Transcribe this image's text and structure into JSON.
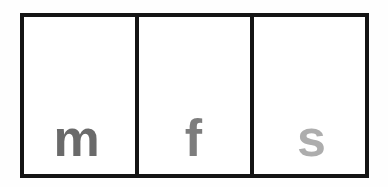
{
  "canvas": {
    "width": 388,
    "height": 187,
    "background_color": "#fefefe"
  },
  "figure": {
    "type": "three-cell-letter-strip",
    "border_color": "#141414",
    "border_width_px": 4,
    "cell_background": "#ffffff"
  },
  "cells": [
    {
      "index": 0,
      "letter": "m",
      "color": "#6a6a6a",
      "shade_label": "dark-gray"
    },
    {
      "index": 1,
      "letter": "f",
      "color": "#7d7d7d",
      "shade_label": "medium-gray"
    },
    {
      "index": 2,
      "letter": "s",
      "color": "#adadad",
      "shade_label": "light-gray"
    }
  ]
}
